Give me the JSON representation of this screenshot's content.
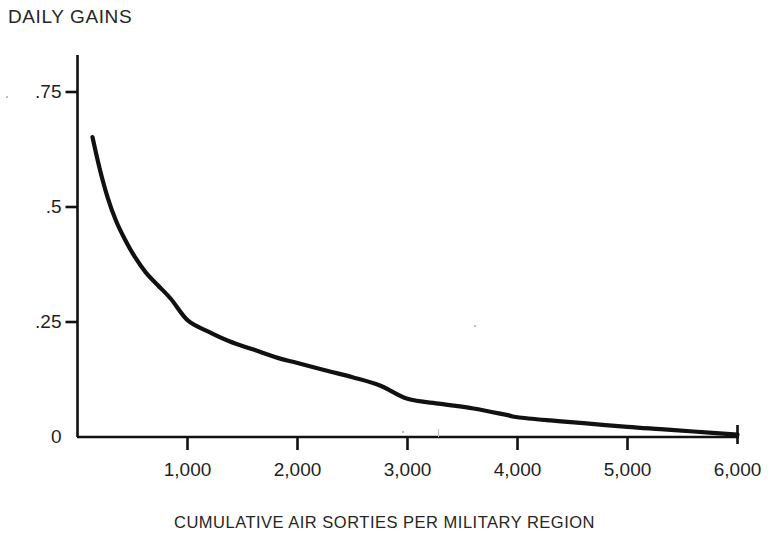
{
  "chart_data": {
    "type": "line",
    "title": "",
    "ylabel": "DAILY GAINS",
    "xlabel": "CUMULATIVE AIR SORTIES PER MILITARY REGION",
    "xlim": [
      0,
      6000
    ],
    "ylim": [
      0,
      0.8
    ],
    "grid": false,
    "legend": "none",
    "x_ticks": [
      {
        "value": 1000,
        "label": "1,000"
      },
      {
        "value": 2000,
        "label": "2,000"
      },
      {
        "value": 3000,
        "label": "3,000"
      },
      {
        "value": 4000,
        "label": "4,000"
      },
      {
        "value": 5000,
        "label": "5,000"
      },
      {
        "value": 6000,
        "label": "6,000"
      }
    ],
    "y_ticks": [
      {
        "value": 0,
        "label": "0"
      },
      {
        "value": 0.25,
        "label": ".25"
      },
      {
        "value": 0.5,
        "label": ".5"
      },
      {
        "value": 0.75,
        "label": ".75"
      }
    ],
    "series": [
      {
        "name": "daily gains",
        "color": "#111111",
        "x": [
          136,
          200,
          275,
          350,
          430,
          520,
          620,
          730,
          850,
          1000,
          1180,
          1380,
          1600,
          1820,
          2000,
          2250,
          2500,
          2750,
          3000,
          3300,
          3600,
          3900,
          4000,
          4300,
          4600,
          5000,
          5300,
          5600,
          6000
        ],
        "y": [
          0.652,
          0.585,
          0.52,
          0.47,
          0.43,
          0.392,
          0.358,
          0.33,
          0.3,
          0.254,
          0.23,
          0.208,
          0.19,
          0.172,
          0.161,
          0.145,
          0.13,
          0.112,
          0.083,
          0.072,
          0.062,
          0.048,
          0.043,
          0.036,
          0.03,
          0.022,
          0.017,
          0.012,
          0.005
        ]
      }
    ]
  },
  "axis": {
    "line_color": "#111111"
  }
}
